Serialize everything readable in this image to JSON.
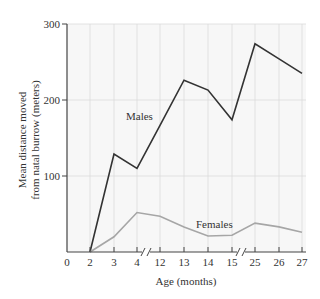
{
  "chart_data": {
    "type": "line",
    "title": "",
    "xlabel": "Age (months)",
    "ylabel": "Mean distance moved from natal burrow (meters)",
    "ylabel_lines": [
      "Mean distance moved",
      "from natal burrow (meters)"
    ],
    "ylim": [
      0,
      300
    ],
    "yticks": [
      100,
      200,
      300
    ],
    "x_tick_labels": [
      "0",
      "2",
      "3",
      "4",
      "12",
      "13",
      "14",
      "15",
      "25",
      "26",
      "27"
    ],
    "axis_breaks": [
      "between 4 and 12",
      "between 15 and 25"
    ],
    "grid": true,
    "categories": [
      "2",
      "3",
      "4",
      "12",
      "13",
      "14",
      "15",
      "25",
      "26",
      "27"
    ],
    "series": [
      {
        "name": "Males",
        "color": "#333333",
        "values": [
          0,
          129,
          110,
          null,
          226,
          213,
          174,
          274,
          null,
          235
        ]
      },
      {
        "name": "Females",
        "color": "#a6a6a6",
        "values": [
          0,
          20,
          52,
          47,
          33,
          21,
          22,
          38,
          33,
          26
        ]
      }
    ],
    "annotations": [
      "Males",
      "Females"
    ]
  }
}
